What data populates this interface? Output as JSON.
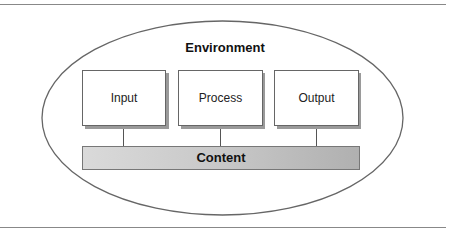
{
  "diagram": {
    "environment": {
      "label": "Environment"
    },
    "boxes": [
      {
        "label": "Input"
      },
      {
        "label": "Process"
      },
      {
        "label": "Output"
      }
    ],
    "content": {
      "label": "Content"
    },
    "colors": {
      "stroke": "#555555",
      "rule": "#888888",
      "box_fill": "#ffffff",
      "shadow": "#9a9a9a",
      "content_gradient_start": "#d8d8d8",
      "content_gradient_end": "#b4b4b4"
    }
  }
}
